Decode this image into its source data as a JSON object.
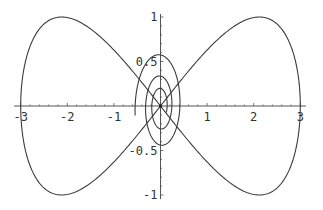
{
  "chart_data": {
    "type": "line",
    "title": "",
    "xlabel": "",
    "ylabel": "",
    "xlim": [
      -3.05,
      3.1
    ],
    "ylim": [
      -1.02,
      1.02
    ],
    "grid": false,
    "legend": null,
    "x_ticks": [
      {
        "value": -3,
        "label": "-3"
      },
      {
        "value": -2,
        "label": "-2"
      },
      {
        "value": -1,
        "label": "-1"
      },
      {
        "value": 1,
        "label": "1"
      },
      {
        "value": 2,
        "label": "2"
      },
      {
        "value": 3,
        "label": "3"
      }
    ],
    "y_ticks": [
      {
        "value": 1,
        "label": "1"
      },
      {
        "value": 0.5,
        "label": "0.5"
      },
      {
        "value": -0.5,
        "label": "-0.5"
      },
      {
        "value": -1,
        "label": "-1"
      }
    ],
    "series": [
      {
        "name": "figure-eight (x = 3 sin t, y = sin 2t)",
        "kind": "parametric",
        "x_amp": 3,
        "x_freq": 1,
        "y_amp": 1,
        "y_freq": 2,
        "t_range": [
          0,
          6.2832
        ],
        "key_points": [
          [
            0,
            0
          ],
          [
            2.12,
            1
          ],
          [
            3,
            0
          ],
          [
            2.12,
            -1
          ],
          [
            0,
            0
          ],
          [
            -2.12,
            1
          ],
          [
            -3,
            0
          ],
          [
            -2.12,
            -1
          ]
        ]
      },
      {
        "name": "inner spiral",
        "kind": "decaying-ellipse-spiral",
        "start": [
          -0.9,
          0.15
        ],
        "x_amp": 0.92,
        "y_amp": 0.7,
        "decay": 0.085,
        "theta_range": [
          2.98,
          19.3
        ],
        "key_points": [
          [
            -0.9,
            0.15
          ],
          [
            0,
            -0.64
          ],
          [
            0.55,
            0
          ],
          [
            0,
            0.49
          ],
          [
            -0.43,
            0
          ],
          [
            0,
            -0.5
          ],
          [
            0.36,
            0
          ],
          [
            0,
            0.38
          ],
          [
            0.2,
            0.28
          ]
        ]
      }
    ],
    "colors": {
      "curve": "#3a3a3a",
      "axis": "#555555"
    }
  }
}
